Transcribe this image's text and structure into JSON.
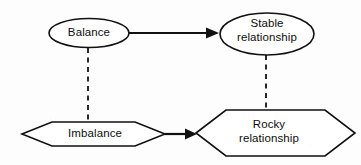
{
  "diagram": {
    "type": "relationship-flow-diagram",
    "background_color": "#fdfdfd",
    "stroke_color": "#111111",
    "fill_color": "#ffffff",
    "nodes": [
      {
        "id": "balance",
        "label": "Balance",
        "shape": "ellipse",
        "center": [
          89,
          33
        ],
        "rx": 40,
        "ry": 14.5
      },
      {
        "id": "stable",
        "label": "Stable\nrelationship",
        "label_line1": "Stable",
        "label_line2": "relationship",
        "shape": "ellipse",
        "center": [
          267,
          34
        ],
        "rx": 47,
        "ry": 21
      },
      {
        "id": "imbalance",
        "label": "Imbalance",
        "shape": "hexagon",
        "center": [
          93.5,
          134
        ],
        "half_width": 71.5,
        "half_height": 12,
        "point_inset": 30
      },
      {
        "id": "rocky",
        "label": "Rocky\nrelationship",
        "label_line1": "Rocky",
        "label_line2": "relationship",
        "shape": "hexagon",
        "center": [
          275.5,
          133
        ],
        "half_width": 79.5,
        "half_height": 23,
        "point_inset": 30
      }
    ],
    "edges": [
      {
        "id": "balance-to-stable",
        "from": "balance",
        "to": "stable",
        "style": "solid",
        "arrow": "single",
        "x1": 129,
        "y1": 33,
        "x2": 219,
        "y2": 33
      },
      {
        "id": "imbalance-to-rocky",
        "from": "imbalance",
        "to": "rocky",
        "style": "solid",
        "arrow": "single",
        "x1": 165,
        "y1": 134,
        "x2": 197,
        "y2": 134
      },
      {
        "id": "balance-imbalance-link",
        "from": "balance",
        "to": "imbalance",
        "style": "dashed",
        "arrow": "none",
        "x1": 88,
        "y1": 48,
        "x2": 88,
        "y2": 128
      },
      {
        "id": "stable-rocky-link",
        "from": "stable",
        "to": "rocky",
        "style": "dashed",
        "arrow": "none",
        "x1": 266,
        "y1": 55,
        "x2": 266,
        "y2": 111
      }
    ]
  }
}
